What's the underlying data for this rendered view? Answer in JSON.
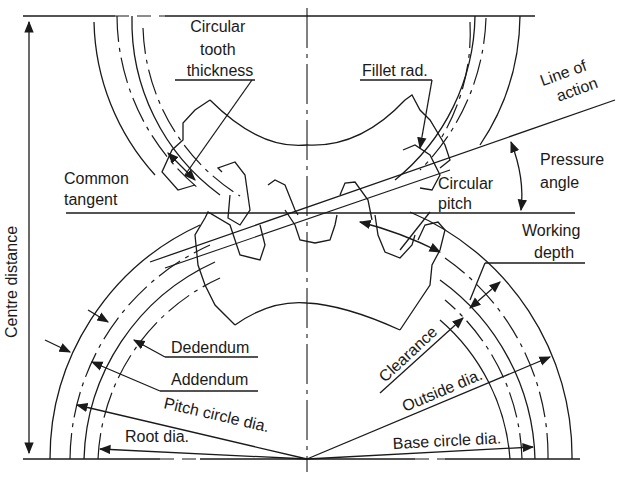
{
  "diagram": {
    "colors": {
      "ink": "#1a1a1a",
      "background": "#ffffff"
    },
    "labels": {
      "circular_tooth_thickness": [
        "Circular",
        "tooth",
        "thickness"
      ],
      "fillet_rad": "Fillet rad.",
      "line_of_action": [
        "Line of",
        "action"
      ],
      "pressure_angle": [
        "Pressure",
        "angle"
      ],
      "common_tangent": [
        "Common",
        "tangent"
      ],
      "circular_pitch": [
        "Circular",
        "pitch"
      ],
      "working_depth": [
        "Working",
        "depth"
      ],
      "centre_distance": "Centre distance",
      "dedendum": "Dedendum",
      "addendum": "Addendum",
      "clearance": "Clearance",
      "outside_dia": "Outside dia.",
      "pitch_circle_dia": "Pitch circle dia.",
      "root_dia": "Root dia.",
      "base_circle_dia": "Base circle dia."
    }
  }
}
